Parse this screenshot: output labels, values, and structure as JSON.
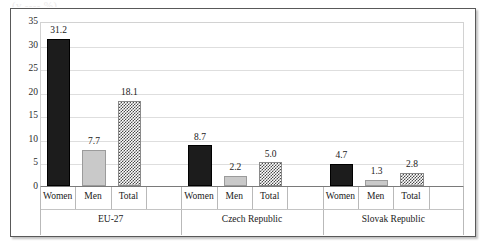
{
  "caption_sliver": "(v ---- %)",
  "chart_data": {
    "type": "bar",
    "title": "",
    "subtitle": "",
    "xlabel": "",
    "ylabel": "",
    "ylim": [
      0,
      35
    ],
    "yticks": [
      0,
      5,
      10,
      15,
      20,
      25,
      30,
      35
    ],
    "grid": true,
    "legend_position": "none",
    "categories": [
      "EU-27",
      "Czech Republic",
      "Slovak Republic"
    ],
    "subcategories": [
      "Women",
      "Men",
      "Total"
    ],
    "series": [
      {
        "name": "Women",
        "values": [
          31.2,
          8.7,
          4.7
        ],
        "style": "solid-black",
        "color": "#1c1c1c"
      },
      {
        "name": "Men",
        "values": [
          7.7,
          2.2,
          1.3
        ],
        "style": "solid-light-gray",
        "color": "#c9c9c9"
      },
      {
        "name": "Total",
        "values": [
          18.1,
          5.0,
          2.8
        ],
        "style": "checkered",
        "color": "#4a4a4a"
      }
    ],
    "bars": [
      {
        "group": "EU-27",
        "label": "Women",
        "value": 31.2,
        "value_label": "31.2",
        "style": "women"
      },
      {
        "group": "EU-27",
        "label": "Men",
        "value": 7.7,
        "value_label": "7.7",
        "style": "men"
      },
      {
        "group": "EU-27",
        "label": "Total",
        "value": 18.1,
        "value_label": "18.1",
        "style": "total"
      },
      {
        "group": "Czech Republic",
        "label": "Women",
        "value": 8.7,
        "value_label": "8.7",
        "style": "women"
      },
      {
        "group": "Czech Republic",
        "label": "Men",
        "value": 2.2,
        "value_label": "2.2",
        "style": "men"
      },
      {
        "group": "Czech Republic",
        "label": "Total",
        "value": 5.0,
        "value_label": "5.0",
        "style": "total"
      },
      {
        "group": "Slovak Republic",
        "label": "Women",
        "value": 4.7,
        "value_label": "4.7",
        "style": "women"
      },
      {
        "group": "Slovak Republic",
        "label": "Men",
        "value": 1.3,
        "value_label": "1.3",
        "style": "men"
      },
      {
        "group": "Slovak Republic",
        "label": "Total",
        "value": 2.8,
        "value_label": "2.8",
        "style": "total"
      }
    ]
  }
}
